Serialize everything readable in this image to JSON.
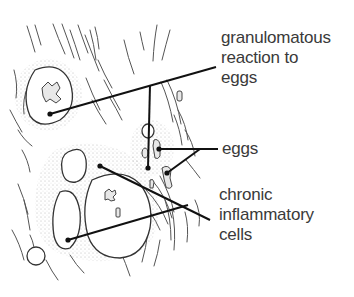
{
  "diagram": {
    "type": "histology-illustration",
    "labels": {
      "granulomatous": {
        "lines": [
          "granulomatous",
          "reaction to",
          "eggs"
        ]
      },
      "eggs": {
        "lines": [
          "eggs"
        ]
      },
      "chronic": {
        "lines": [
          "chronic",
          "inflammatory",
          "cells"
        ]
      }
    },
    "colors": {
      "background": "#ffffff",
      "text": "#3a3a3a",
      "leader": "#111111",
      "tissue": "#555555"
    }
  }
}
